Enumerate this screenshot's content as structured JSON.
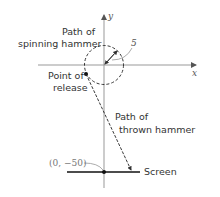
{
  "diagram": {
    "axes": {
      "x_label": "x",
      "y_label": "y"
    },
    "circle": {
      "label_line1": "Path of",
      "label_line2": "spinning hammer",
      "radius_label": "5"
    },
    "release": {
      "label_line1": "Point of",
      "label_line2": "release"
    },
    "thrown": {
      "label_line1": "Path of",
      "label_line2": "thrown hammer"
    },
    "screen": {
      "label": "Screen",
      "point_label": "(0, −50)"
    },
    "colors": {
      "axis": "#999999",
      "ink": "#222222",
      "leader": "#888888"
    }
  }
}
